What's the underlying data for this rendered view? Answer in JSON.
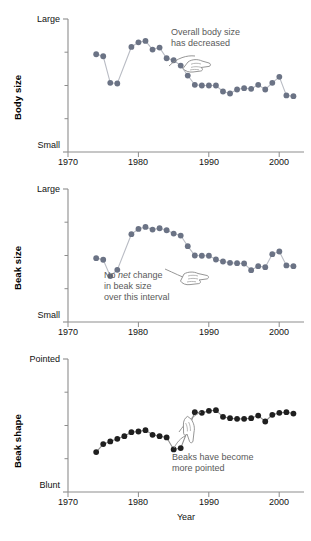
{
  "figure": {
    "xlabel": "Year",
    "xticks": [
      1970,
      1980,
      1990,
      2000
    ],
    "xlim": [
      1969,
      2002.5
    ],
    "panels": [
      {
        "id": "body-size",
        "axis_title": "Body size",
        "ytop": "Large",
        "ybot": "Small",
        "annotation_line1": "Overall body size",
        "annotation_line2": "has decreased",
        "marker_color": "#6b7385",
        "line_color": "#b9bcc4"
      },
      {
        "id": "beak-size",
        "axis_title": "Beak size",
        "ytop": "Large",
        "ybot": "Small",
        "annotation_line1_a": "No ",
        "annotation_line1_em": "net",
        "annotation_line1_b": " change",
        "annotation_line2": "in beak size",
        "annotation_line3": "over this interval",
        "marker_color": "#6b7385",
        "line_color": "#b9bcc4"
      },
      {
        "id": "beak-shape",
        "axis_title": "Beak shape",
        "ytop": "Pointed",
        "ybot": "Blunt",
        "annotation_line1": "Beaks have become",
        "annotation_line2": "more pointed",
        "marker_color": "#1f1f1f",
        "line_color": "#8e8e8e"
      }
    ]
  },
  "chart_data": [
    {
      "type": "line",
      "title": "Body size",
      "xlabel": "Year",
      "ylabel": "Body size",
      "ylim": [
        0,
        1
      ],
      "yticklabels": [
        "Small",
        "Large"
      ],
      "xlim": [
        1969,
        2002.5
      ],
      "xticks": [
        1970,
        1980,
        1990,
        2000
      ],
      "grid": false,
      "legend": "none",
      "annotation": "Overall body size has decreased",
      "x": [
        1973,
        1974,
        1975,
        1976,
        1978,
        1979,
        1980,
        1981,
        1982,
        1983,
        1984,
        1985,
        1986,
        1987,
        1988,
        1989,
        1990,
        1991,
        1992,
        1993,
        1994,
        1995,
        1996,
        1997,
        1998,
        1999,
        2000,
        2001
      ],
      "y": [
        0.735,
        0.72,
        0.52,
        0.515,
        0.79,
        0.825,
        0.835,
        0.77,
        0.785,
        0.705,
        0.69,
        0.65,
        0.575,
        0.505,
        0.5,
        0.5,
        0.5,
        0.455,
        0.44,
        0.47,
        0.48,
        0.475,
        0.505,
        0.47,
        0.52,
        0.565,
        0.425,
        0.42
      ]
    },
    {
      "type": "line",
      "title": "Beak size",
      "xlabel": "Year",
      "ylabel": "Beak size",
      "ylim": [
        0,
        1
      ],
      "yticklabels": [
        "Small",
        "Large"
      ],
      "xlim": [
        1969,
        2002.5
      ],
      "xticks": [
        1970,
        1980,
        1990,
        2000
      ],
      "grid": false,
      "legend": "none",
      "annotation": "No net change in beak size over this interval",
      "x": [
        1973,
        1974,
        1975,
        1976,
        1978,
        1979,
        1980,
        1981,
        1982,
        1983,
        1984,
        1985,
        1986,
        1987,
        1988,
        1989,
        1990,
        1991,
        1992,
        1993,
        1994,
        1995,
        1996,
        1997,
        1998,
        1999,
        2000,
        2001
      ],
      "y": [
        0.48,
        0.468,
        0.345,
        0.392,
        0.66,
        0.7,
        0.715,
        0.695,
        0.705,
        0.69,
        0.665,
        0.65,
        0.57,
        0.5,
        0.498,
        0.498,
        0.47,
        0.455,
        0.445,
        0.442,
        0.44,
        0.39,
        0.42,
        0.412,
        0.51,
        0.53,
        0.425,
        0.42
      ]
    },
    {
      "type": "line",
      "title": "Beak shape",
      "xlabel": "Year",
      "ylabel": "Beak shape",
      "ylim": [
        0,
        1
      ],
      "yticklabels": [
        "Blunt",
        "Pointed"
      ],
      "xlim": [
        1969,
        2002.5
      ],
      "xticks": [
        1970,
        1980,
        1990,
        2000
      ],
      "grid": false,
      "legend": "none",
      "annotation": "Beaks have become more pointed",
      "x": [
        1973,
        1974,
        1975,
        1976,
        1977,
        1978,
        1979,
        1980,
        1981,
        1982,
        1983,
        1984,
        1985,
        1987,
        1988,
        1989,
        1990,
        1991,
        1992,
        1993,
        1994,
        1995,
        1996,
        1997,
        1998,
        1999,
        2000,
        2001
      ],
      "y": [
        0.3,
        0.36,
        0.38,
        0.4,
        0.42,
        0.45,
        0.455,
        0.465,
        0.43,
        0.42,
        0.41,
        0.32,
        0.33,
        0.6,
        0.595,
        0.61,
        0.615,
        0.565,
        0.555,
        0.55,
        0.55,
        0.555,
        0.575,
        0.53,
        0.58,
        0.595,
        0.6,
        0.59
      ]
    }
  ]
}
